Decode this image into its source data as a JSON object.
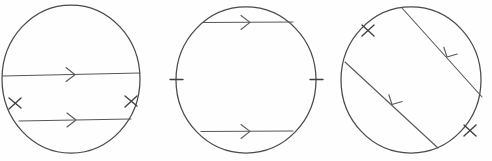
{
  "figure": {
    "background_color": "#fefefe",
    "stroke_color": "#4a4a4a",
    "caption": "",
    "width": 492,
    "height": 161,
    "figures": [
      {
        "id": "circle-1",
        "label": "Circle 1 — two parallel horizontal chords, one through the center",
        "center": {
          "cx": 71,
          "cy": 79
        },
        "radius": {
          "rx": 70,
          "ry": 75
        },
        "chords": [
          {
            "name": "chord-upper",
            "kind": "diameter",
            "x1": 2,
            "y1": 76,
            "x2": 140,
            "y2": 73,
            "arrow": {
              "count": 1,
              "direction": "right",
              "at": 0.5
            }
          },
          {
            "name": "chord-lower",
            "kind": "chord",
            "x1": 19,
            "y1": 121,
            "x2": 131,
            "y2": 119,
            "arrow": {
              "count": 1,
              "direction": "right",
              "at": 0.5
            }
          }
        ],
        "arc_ticks": [
          {
            "name": "tick-left",
            "count": 2,
            "x": 15,
            "y": 103,
            "angle": 200
          },
          {
            "name": "tick-right",
            "count": 2,
            "x": 131,
            "y": 101,
            "angle": 340
          }
        ]
      },
      {
        "id": "circle-2",
        "label": "Circle 2 — two parallel horizontal chords symmetric about the center",
        "center": {
          "cx": 246,
          "cy": 80
        },
        "radius": {
          "rx": 71,
          "ry": 74
        },
        "chords": [
          {
            "name": "chord-upper",
            "kind": "chord",
            "x1": 203,
            "y1": 22,
            "x2": 292,
            "y2": 22,
            "arrow": {
              "count": 1,
              "direction": "right",
              "at": 0.5
            }
          },
          {
            "name": "chord-lower",
            "kind": "chord",
            "x1": 201,
            "y1": 131,
            "x2": 292,
            "y2": 131,
            "arrow": {
              "count": 1,
              "direction": "right",
              "at": 0.55
            }
          }
        ],
        "arc_ticks": [
          {
            "name": "tick-left",
            "count": 1,
            "x": 175,
            "y": 79,
            "angle": 180
          },
          {
            "name": "tick-right",
            "count": 1,
            "x": 317,
            "y": 79,
            "angle": 0
          }
        ]
      },
      {
        "id": "circle-3",
        "label": "Circle 3 — two parallel diagonal chords sloping down to the right",
        "center": {
          "cx": 411,
          "cy": 80
        },
        "radius": {
          "rx": 70,
          "ry": 74
        },
        "chords": [
          {
            "name": "chord-upper",
            "kind": "chord",
            "x1": 403,
            "y1": 8,
            "x2": 481,
            "y2": 96,
            "arrow": {
              "count": 1,
              "direction": "down-right",
              "at": 0.55
            }
          },
          {
            "name": "chord-lower",
            "kind": "chord",
            "x1": 345,
            "y1": 63,
            "x2": 437,
            "y2": 148,
            "arrow": {
              "count": 1,
              "direction": "down-right",
              "at": 0.52
            }
          }
        ],
        "arc_ticks": [
          {
            "name": "tick-upper-left",
            "count": 2,
            "x": 368,
            "y": 31,
            "angle": 130
          },
          {
            "name": "tick-lower-right",
            "count": 2,
            "x": 470,
            "y": 131,
            "angle": 318
          }
        ]
      }
    ]
  }
}
